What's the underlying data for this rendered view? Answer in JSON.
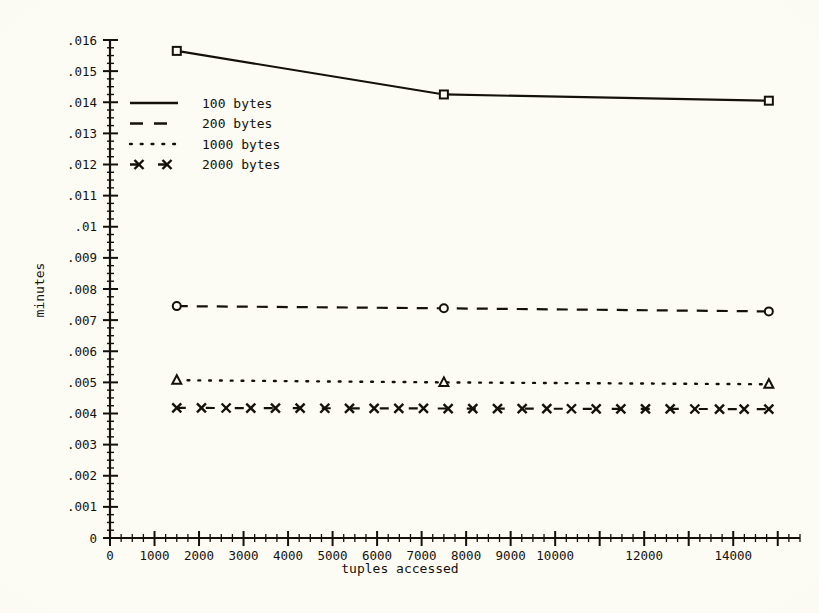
{
  "chart_data": {
    "type": "line",
    "title": "",
    "xlabel": "tuples accessed",
    "ylabel": "minutes",
    "xlim": [
      0,
      15500
    ],
    "ylim": [
      0,
      0.016
    ],
    "grid": false,
    "legend_position": "upper-left-inside",
    "x_major_step": 1000,
    "x_minor_step": 250,
    "y_major_step": 0.001,
    "y_minor_step": 0.00025,
    "x_tick_values": [
      0,
      1000,
      2000,
      3000,
      4000,
      5000,
      6000,
      7000,
      8000,
      9000,
      10000,
      11000,
      12000,
      13000,
      14000,
      15000
    ],
    "x_tick_labels": [
      "0",
      "1000",
      "2000",
      "3000",
      "4000",
      "5000",
      "6000",
      "7000",
      "8000",
      "9000",
      "10000",
      "",
      "12000",
      "",
      "14000",
      ""
    ],
    "y_tick_values": [
      0,
      0.001,
      0.002,
      0.003,
      0.004,
      0.005,
      0.006,
      0.007,
      0.008,
      0.009,
      0.01,
      0.011,
      0.012,
      0.013,
      0.014,
      0.015,
      0.016
    ],
    "y_tick_labels": [
      "0",
      ".001",
      ".002",
      ".003",
      ".004",
      ".005",
      ".006",
      ".007",
      ".008",
      ".009",
      ".01",
      ".011",
      ".012",
      ".013",
      ".014",
      ".015",
      ".016"
    ],
    "x": [
      1500,
      7500,
      14800
    ],
    "series": [
      {
        "name": "100 bytes",
        "label": "100 bytes",
        "linestyle": "solid",
        "marker": "square",
        "color": "#14110c",
        "values": [
          0.01565,
          0.01425,
          0.01405
        ]
      },
      {
        "name": "200 bytes",
        "label": "200 bytes",
        "linestyle": "dashed",
        "marker": "circle",
        "color": "#14110c",
        "values": [
          0.00745,
          0.00738,
          0.00728
        ]
      },
      {
        "name": "1000 bytes",
        "label": "1000 bytes",
        "linestyle": "dotted",
        "marker": "triangle",
        "color": "#14110c",
        "values": [
          0.00507,
          0.005,
          0.00494
        ]
      },
      {
        "name": "2000 bytes",
        "label": "2000 bytes",
        "linestyle": "dash-x",
        "marker": "x",
        "color": "#14110c",
        "values": [
          0.00418,
          0.00416,
          0.00414
        ]
      }
    ]
  },
  "legend": {
    "entries": [
      {
        "label": "100 bytes",
        "style": "solid"
      },
      {
        "label": "200 bytes",
        "style": "dashed"
      },
      {
        "label": "1000 bytes",
        "style": "dotted"
      },
      {
        "label": "2000 bytes",
        "style": "dash-x"
      }
    ]
  },
  "axes": {
    "x_title": "tuples accessed",
    "y_title": "minutes"
  },
  "colors": {
    "ink": "#14110c",
    "paper": "#fdfcf4"
  }
}
